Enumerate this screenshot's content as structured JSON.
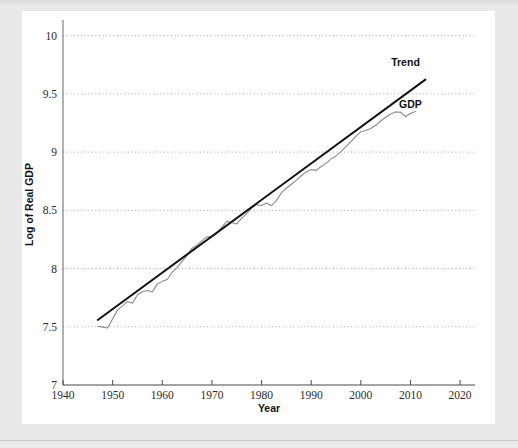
{
  "page": {
    "background_color": "#e9e9ea",
    "panel_color": "#ffffff",
    "faint_header_text": "​"
  },
  "chart_data": {
    "type": "line",
    "title": "",
    "xlabel": "Year",
    "ylabel": "Log of Real GDP",
    "xlim": [
      1940,
      2023
    ],
    "ylim": [
      7,
      10.1
    ],
    "xticks": [
      1940,
      1950,
      1960,
      1970,
      1980,
      1990,
      2000,
      2010,
      2020
    ],
    "yticks": [
      7,
      7.5,
      8,
      8.5,
      9,
      9.5,
      10
    ],
    "xtick_labels": [
      "1940",
      "1950",
      "1960",
      "1970",
      "1980",
      "1990",
      "2000",
      "2010",
      "2020"
    ],
    "ytick_labels": [
      "7",
      "7.5",
      "8",
      "8.5",
      "9",
      "9.5",
      "10"
    ],
    "grid": "horizontal-dotted",
    "grid_color": "#9a9a9a",
    "legend_position": "inline-annotations",
    "annotations": [
      {
        "name": "trend-label",
        "text": "Trend",
        "x": 2009,
        "y": 9.74
      },
      {
        "name": "gdp-label",
        "text": "GDP",
        "x": 2010,
        "y": 9.38
      }
    ],
    "series": [
      {
        "name": "GDP",
        "color": "#8a8a8a",
        "width": 1.1,
        "x": [
          1947,
          1948,
          1949,
          1950,
          1951,
          1952,
          1953,
          1954,
          1955,
          1956,
          1957,
          1958,
          1959,
          1960,
          1961,
          1962,
          1963,
          1964,
          1965,
          1966,
          1967,
          1968,
          1969,
          1970,
          1971,
          1972,
          1973,
          1974,
          1975,
          1976,
          1977,
          1978,
          1979,
          1980,
          1981,
          1982,
          1983,
          1984,
          1985,
          1986,
          1987,
          1988,
          1989,
          1990,
          1991,
          1992,
          1993,
          1994,
          1995,
          1996,
          1997,
          1998,
          1999,
          2000,
          2001,
          2002,
          2003,
          2004,
          2005,
          2006,
          2007,
          2008,
          2009,
          2010,
          2011
        ],
        "values": [
          7.505,
          7.497,
          7.49,
          7.568,
          7.645,
          7.68,
          7.718,
          7.702,
          7.775,
          7.8,
          7.812,
          7.798,
          7.866,
          7.89,
          7.906,
          7.968,
          8.01,
          8.062,
          8.115,
          8.175,
          8.2,
          8.24,
          8.272,
          8.272,
          8.303,
          8.353,
          8.405,
          8.393,
          8.383,
          8.433,
          8.472,
          8.521,
          8.549,
          8.542,
          8.563,
          8.54,
          8.583,
          8.65,
          8.69,
          8.724,
          8.757,
          8.797,
          8.83,
          8.85,
          8.843,
          8.876,
          8.903,
          8.942,
          8.967,
          9.004,
          9.047,
          9.089,
          9.135,
          9.175,
          9.185,
          9.203,
          9.23,
          9.267,
          9.299,
          9.327,
          9.345,
          9.342,
          9.306,
          9.331,
          9.348
        ]
      },
      {
        "name": "Trend",
        "color": "#111111",
        "width": 2.0,
        "x": [
          1947,
          2013
        ],
        "values": [
          7.558,
          9.622
        ]
      }
    ]
  }
}
